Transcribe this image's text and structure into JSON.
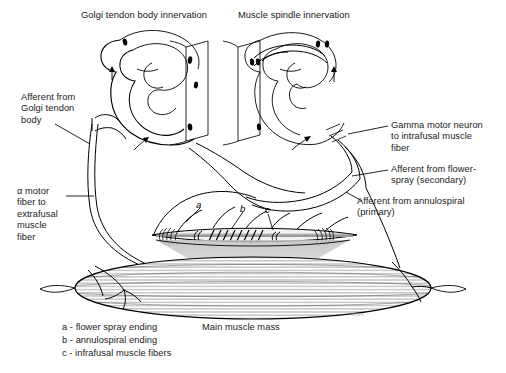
{
  "figure": {
    "kind": "anatomical-diagram",
    "background_color": "#ffffff",
    "line_color": "#000000",
    "shading_color": "#b4b4b4"
  },
  "titles": {
    "left": "Golgi tendon body innervation",
    "right": "Muscle spindle innervation"
  },
  "labels": {
    "afferent_golgi": "Afferent from\nGolgi tendon\nbody",
    "alpha_motor": "α motor\nfiber to\nextrafusal\nmuscle\nfiber",
    "gamma_motor": "Gamma motor neuron\nto intrafusal muscle\nfiber",
    "afferent_flower_spray": "Afferent from flower-\nspray (secondary)",
    "afferent_annulospiral": "Afferent from annulospiral\n(primary)",
    "main_muscle_mass": "Main muscle mass"
  },
  "markers": [
    {
      "id": "a",
      "text": "a"
    },
    {
      "id": "b",
      "text": "b"
    },
    {
      "id": "c",
      "text": "c"
    }
  ],
  "legend": {
    "items": [
      "a - flower spray ending",
      "b - annulospiral ending",
      "c - infrafusal muscle fibers"
    ]
  },
  "watermark": {
    "text": "скан"
  }
}
